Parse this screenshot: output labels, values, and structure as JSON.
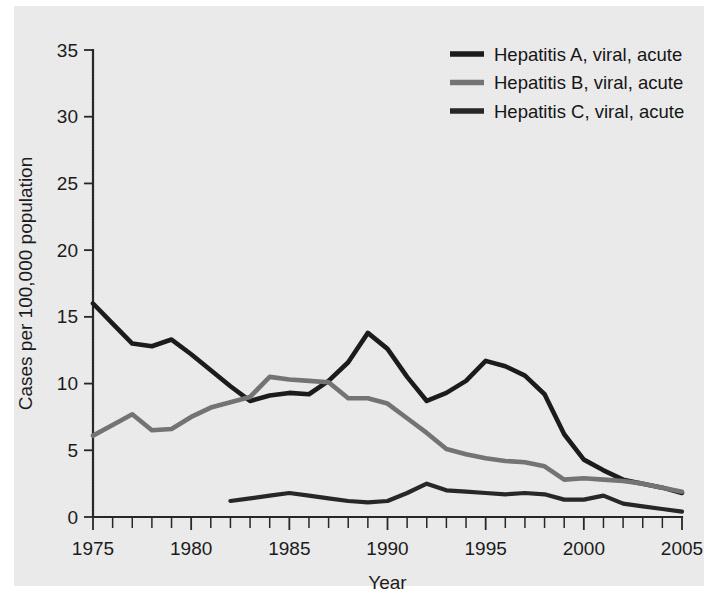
{
  "chart_data": {
    "type": "line",
    "title": "",
    "xlabel": "Year",
    "ylabel": "Cases per 100,000 population",
    "xlim": [
      1975,
      2005
    ],
    "ylim": [
      0,
      35
    ],
    "grid": false,
    "legend_position": "top-right",
    "x_tick_labels": [
      "1975",
      "1980",
      "1985",
      "1990",
      "1995",
      "2000",
      "2005"
    ],
    "x_tick_values": [
      1975,
      1980,
      1985,
      1990,
      1995,
      2000,
      2005
    ],
    "x_minor_tick_step": 1,
    "y_tick_labels": [
      "0",
      "5",
      "10",
      "15",
      "20",
      "25",
      "30",
      "35"
    ],
    "y_tick_values": [
      0,
      5,
      10,
      15,
      20,
      25,
      30,
      35
    ],
    "x": [
      1975,
      1976,
      1977,
      1978,
      1979,
      1980,
      1981,
      1982,
      1983,
      1984,
      1985,
      1986,
      1987,
      1988,
      1989,
      1990,
      1991,
      1992,
      1993,
      1994,
      1995,
      1996,
      1997,
      1998,
      1999,
      2000,
      2001,
      2002,
      2003,
      2004,
      2005
    ],
    "series": [
      {
        "name": "Hepatitis A, viral, acute",
        "color": "#1a1a1a",
        "line_width": 4.6,
        "x": [
          1975,
          1976,
          1977,
          1978,
          1979,
          1980,
          1981,
          1982,
          1983,
          1984,
          1985,
          1986,
          1987,
          1988,
          1989,
          1990,
          1991,
          1992,
          1993,
          1994,
          1995,
          1996,
          1997,
          1998,
          1999,
          2000,
          2001,
          2002,
          2003,
          2004,
          2005
        ],
        "values": [
          16.0,
          14.5,
          13.0,
          12.8,
          13.3,
          12.2,
          11.0,
          9.8,
          8.7,
          9.1,
          9.3,
          9.2,
          10.2,
          11.6,
          13.8,
          12.6,
          10.5,
          8.7,
          9.3,
          10.2,
          11.7,
          11.3,
          10.6,
          9.2,
          6.2,
          4.3,
          3.5,
          2.8,
          2.5,
          2.2,
          1.8
        ]
      },
      {
        "name": "Hepatitis B, viral, acute",
        "color": "#737373",
        "line_width": 4.6,
        "x": [
          1975,
          1976,
          1977,
          1978,
          1979,
          1980,
          1981,
          1982,
          1983,
          1984,
          1985,
          1986,
          1987,
          1988,
          1989,
          1990,
          1991,
          1992,
          1993,
          1994,
          1995,
          1996,
          1997,
          1998,
          1999,
          2000,
          2001,
          2002,
          2003,
          2004,
          2005
        ],
        "values": [
          6.1,
          6.9,
          7.7,
          6.5,
          6.6,
          7.5,
          8.2,
          8.6,
          9.0,
          10.5,
          10.3,
          10.2,
          10.1,
          8.9,
          8.9,
          8.5,
          7.4,
          6.3,
          5.1,
          4.7,
          4.4,
          4.2,
          4.1,
          3.8,
          2.8,
          2.9,
          2.8,
          2.7,
          2.5,
          2.2,
          1.9
        ]
      },
      {
        "name": "Hepatitis C, viral, acute",
        "color": "#262626",
        "line_width": 4.2,
        "x": [
          1982,
          1983,
          1984,
          1985,
          1986,
          1987,
          1988,
          1989,
          1990,
          1991,
          1992,
          1993,
          1994,
          1995,
          1996,
          1997,
          1998,
          1999,
          2000,
          2001,
          2002,
          2003,
          2004,
          2005
        ],
        "values": [
          1.2,
          1.4,
          1.6,
          1.8,
          1.6,
          1.4,
          1.2,
          1.1,
          1.2,
          1.8,
          2.5,
          2.0,
          1.9,
          1.8,
          1.7,
          1.8,
          1.7,
          1.3,
          1.3,
          1.6,
          1.0,
          0.8,
          0.6,
          0.4
        ]
      }
    ]
  },
  "legend": {
    "items": [
      {
        "label": "Hepatitis A, viral, acute",
        "color": "#1a1a1a"
      },
      {
        "label": "Hepatitis B, viral, acute",
        "color": "#737373"
      },
      {
        "label": "Hepatitis C, viral, acute",
        "color": "#262626"
      }
    ]
  },
  "axes": {
    "x_title": "Year",
    "y_title": "Cases per 100,000 population"
  }
}
